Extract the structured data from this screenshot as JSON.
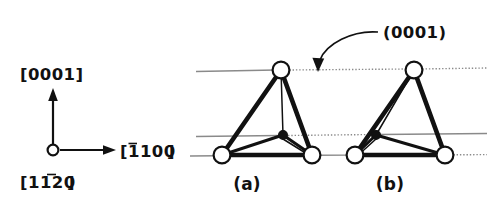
{
  "figure": {
    "title_visible": false,
    "background_color": "#ffffff",
    "ink_color": "#111111",
    "reference_line_color": "#8a8a8a"
  },
  "axes_key": {
    "name": "crystal-direction-axes",
    "origin_marker": "open-circle",
    "vertical": {
      "label_prefix": "[",
      "label_digits": "0001",
      "label_suffix": "]",
      "label_text": "[0001]",
      "overbar_digits": [],
      "direction": "up"
    },
    "horizontal": {
      "label_prefix": "[",
      "label_digits": "1100",
      "label_suffix": "]",
      "label_text": "[1100]",
      "overbar_digits": [
        0
      ],
      "direction": "right"
    },
    "out_of_plane": {
      "label_prefix": "[",
      "label_digits": "1120",
      "label_suffix": "]",
      "label_text": "[1120]",
      "overbar_digits": [
        2
      ],
      "direction": "out-of-page"
    }
  },
  "callout": {
    "name": "basal-plane-callout",
    "label_text": "(0001)",
    "arrow_style": "curved-arrow",
    "points_to": "top-reference-line"
  },
  "reference_planes": [
    {
      "name": "top-basal-plane",
      "y": 70,
      "style": "solid-then-dotted"
    },
    {
      "name": "middle-basal-plane",
      "y": 135,
      "style": "solid-then-dotted"
    },
    {
      "name": "bottom-basal-plane",
      "y": 155,
      "style": "solid-then-dotted"
    }
  ],
  "tetrahedra": [
    {
      "name": "tetrahedron-a",
      "label_text": "(a)",
      "orientation": "apex-up",
      "nodes": [
        {
          "name": "apex-node",
          "type": "open-circle",
          "x": 281,
          "y": 70
        },
        {
          "name": "center-node",
          "type": "filled-circle",
          "x": 283,
          "y": 135
        },
        {
          "name": "base-left-node",
          "type": "open-circle",
          "x": 222,
          "y": 155
        },
        {
          "name": "base-right-node",
          "type": "open-circle",
          "x": 312,
          "y": 155
        }
      ]
    },
    {
      "name": "tetrahedron-b",
      "label_text": "(b)",
      "orientation": "apex-up",
      "nodes": [
        {
          "name": "apex-node",
          "type": "open-circle",
          "x": 414,
          "y": 70
        },
        {
          "name": "center-node",
          "type": "filled-circle",
          "x": 376,
          "y": 135
        },
        {
          "name": "base-left-node",
          "type": "open-circle",
          "x": 355,
          "y": 155
        },
        {
          "name": "base-right-node",
          "type": "open-circle",
          "x": 445,
          "y": 155
        }
      ]
    }
  ]
}
